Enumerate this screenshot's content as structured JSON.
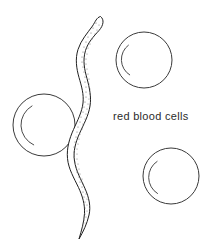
{
  "diagram": {
    "background_color": "#ffffff",
    "line_color": "#3a3a3a",
    "label": {
      "text": "red blood cells",
      "color": "#2b2b2b",
      "x": 113,
      "y": 110,
      "font_size_px": 11
    },
    "cells": [
      {
        "name": "red-blood-cell-top-right",
        "cx": 144,
        "cy": 60,
        "r": 28,
        "inner_arc": {
          "cx": 140,
          "cy": 60,
          "r": 18,
          "start_deg": 130,
          "end_deg": 235,
          "description": "crescent concavity arc opening to the right"
        }
      },
      {
        "name": "red-blood-cell-left",
        "cx": 44,
        "cy": 125,
        "r": 31,
        "inner_arc": {
          "cx": 43,
          "cy": 125,
          "r": 22,
          "start_deg": 120,
          "end_deg": 245,
          "description": "large crescent concavity arc opening to the right"
        }
      },
      {
        "name": "red-blood-cell-bottom-right",
        "cx": 171,
        "cy": 176,
        "r": 28,
        "inner_arc": {
          "cx": 168,
          "cy": 177,
          "r": 19,
          "start_deg": 125,
          "end_deg": 240,
          "description": "crescent concavity arc opening to the right"
        }
      }
    ],
    "worm": {
      "name": "parasitic-worm",
      "fill_color": "#ffffff",
      "stroke_color": "#1f1f1f",
      "stipple_color": "#6e6e6e",
      "texture": "stippled",
      "head_position": {
        "x": 100,
        "y": 16
      },
      "tail_position": {
        "x": 79,
        "y": 239
      },
      "body_shape": "sinuous S-curve, widest at mid-body, tapering to a fine pointed tail"
    }
  }
}
